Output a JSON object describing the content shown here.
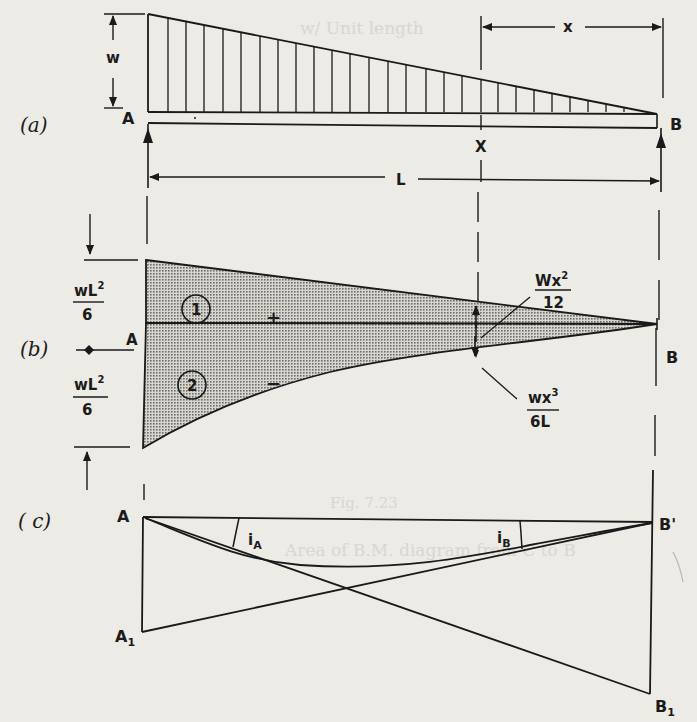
{
  "figure": {
    "background": "#ecebe6",
    "ink": "#1a1a1a",
    "hatch_fill": "#b9b8b2"
  },
  "part_a": {
    "tag": "(a)",
    "label_A": "A",
    "label_B": "B",
    "section_label": "X",
    "load_intensity": "w",
    "span_label": "L",
    "distance_label": "x",
    "load_type": "triangular (uniformly varying) load, max w at A, zero at B"
  },
  "part_b": {
    "tag": "(b)",
    "label_A": "A",
    "label_B": "B",
    "top_value": {
      "num": "wL",
      "sup": "2",
      "den": "6"
    },
    "bottom_value": {
      "num": "wL",
      "sup": "2",
      "den": "6"
    },
    "region_1": "1",
    "region_2": "2",
    "region_1_sign": "+",
    "region_2_sign": "−",
    "section_top": {
      "num": "Wx",
      "sup": "2",
      "den": "12"
    },
    "section_bottom": {
      "num": "wx",
      "sup": "3",
      "den": "6L"
    }
  },
  "part_c": {
    "tag": "( c)",
    "label_A": "A",
    "label_A1": "A",
    "label_A1_sub": "1",
    "label_B": "B'",
    "label_B1": "B",
    "label_B1_sub": "1",
    "slope_A": "i",
    "slope_A_sub": "A",
    "slope_B": "i",
    "slope_B_sub": "B"
  },
  "bleed_through": {
    "line1": "w/ Unit length",
    "line2": "Fig. 7.23",
    "line3": "Area of B.M. diagram from C to B"
  }
}
